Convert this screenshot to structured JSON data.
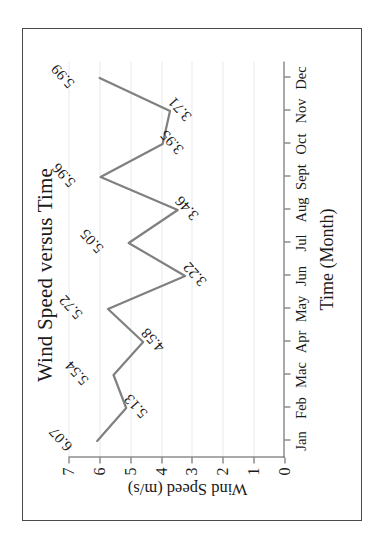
{
  "figure": {
    "title": "Wind Speed versus Time",
    "rotation_note": "chart rendered rotated 90 degrees counter-clockwise"
  },
  "axes": {
    "x_title": "Time (Month)",
    "y_title": "Wind Speed  (m/s)",
    "x_ticks": [
      "Jan",
      "Feb",
      "Mac",
      "Apr",
      "May",
      "Jun",
      "Jul",
      "Aug",
      "Sept",
      "Oct",
      "Nov",
      "Dec"
    ],
    "y_ticks": [
      "0",
      "1",
      "2",
      "3",
      "4",
      "5",
      "6",
      "7"
    ]
  },
  "colors": {
    "line": "#808080",
    "axis": "#555555",
    "grid": "#e6e9ef",
    "border": "#4a4a4a",
    "text": "#1a1a1a"
  },
  "chart_data": {
    "type": "line",
    "title": "Wind Speed versus Time",
    "xlabel": "Time (Month)",
    "ylabel": "Wind Speed  (m/s)",
    "categories": [
      "Jan",
      "Feb",
      "Mac",
      "Apr",
      "May",
      "Jun",
      "Jul",
      "Aug",
      "Sept",
      "Oct",
      "Nov",
      "Dec"
    ],
    "values": [
      6.07,
      5.13,
      5.54,
      4.58,
      5.72,
      3.22,
      5.05,
      3.46,
      5.96,
      3.95,
      3.71,
      5.99
    ],
    "data_labels": [
      "6.07",
      "5.13",
      "5.54",
      "4.58",
      "5.72",
      "3.22",
      "5.05",
      "3.46",
      "5.96",
      "3.95",
      "3.71",
      "5.99"
    ],
    "ylim": [
      0,
      7
    ],
    "ytick_values": [
      0,
      1,
      2,
      3,
      4,
      5,
      6,
      7
    ],
    "grid": true,
    "legend": false,
    "series": [
      {
        "name": "Wind Speed",
        "values": [
          6.07,
          5.13,
          5.54,
          4.58,
          5.72,
          3.22,
          5.05,
          3.46,
          5.96,
          3.95,
          3.71,
          5.99
        ]
      }
    ]
  }
}
